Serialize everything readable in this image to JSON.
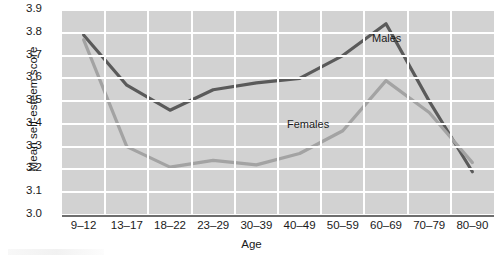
{
  "chart_data": {
    "type": "line",
    "title": "",
    "xlabel": "Age",
    "ylabel": "Mean self-esteem score",
    "categories": [
      "9–12",
      "13–17",
      "18–22",
      "23–29",
      "30–39",
      "40–49",
      "50–59",
      "60–69",
      "70–79",
      "80–90"
    ],
    "ylim": [
      3.0,
      3.9
    ],
    "ytick_labels": [
      "3.9",
      "3.8",
      "3.7",
      "3.6",
      "3.5",
      "3.4",
      "3.3",
      "3.2",
      "3.1",
      "3.0"
    ],
    "ytick_values": [
      3.9,
      3.8,
      3.7,
      3.6,
      3.5,
      3.4,
      3.3,
      3.2,
      3.1,
      3.0
    ],
    "grid": true,
    "legend_position": "inline-annotations",
    "series": [
      {
        "name": "Males",
        "color": "#5a5a5a",
        "values": [
          3.79,
          3.57,
          3.46,
          3.55,
          3.58,
          3.6,
          3.7,
          3.84,
          3.5,
          3.19
        ]
      },
      {
        "name": "Females",
        "color": "#a3a3a3",
        "values": [
          3.77,
          3.3,
          3.21,
          3.24,
          3.22,
          3.27,
          3.37,
          3.59,
          3.45,
          3.23
        ]
      }
    ],
    "annotations": [
      {
        "text": "Males",
        "series": "Males"
      },
      {
        "text": "Females",
        "series": "Females"
      }
    ],
    "colors": {
      "plot_background": "#d2d2d2",
      "gridline": "#ffffff",
      "axis": "#6e6e6e",
      "text": "#1a1a1a"
    }
  }
}
